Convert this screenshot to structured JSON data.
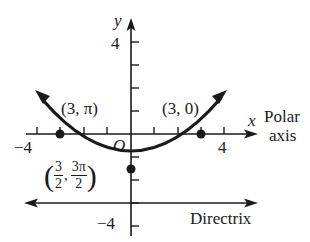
{
  "diagram": {
    "type": "parabola-polar-graph",
    "axes": {
      "x_label": "x",
      "y_label": "y",
      "polar_axis_label_line1": "Polar",
      "polar_axis_label_line2": "axis",
      "origin_label": "O",
      "x_tick_labels": {
        "neg": "−4",
        "pos": "4"
      },
      "y_tick_labels": {
        "pos": "4",
        "neg": "−4"
      },
      "x_range": [
        -4,
        4
      ],
      "y_range": [
        -4,
        4
      ]
    },
    "points": [
      {
        "label": "(3, π)",
        "x": -3,
        "y": 0
      },
      {
        "label": "(3, 0)",
        "x": 3,
        "y": 0
      },
      {
        "label_num1": "3",
        "label_den1": "2",
        "label_num2": "3π",
        "label_den2": "2",
        "x": 0,
        "y": -1.5
      }
    ],
    "directrix_label": "Directrix",
    "directrix_y": -3,
    "colors": {
      "ink": "#1a1a1a",
      "background": "#ffffff"
    }
  }
}
